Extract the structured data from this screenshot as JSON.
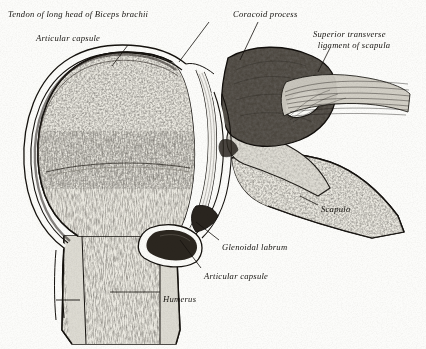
{
  "figure": {
    "style": "engraving",
    "background_color": "#fcfcfa",
    "ink_color": "#15130f"
  },
  "labels": [
    {
      "id": "tendon-biceps",
      "text": "Tendon of long head of Biceps brachii",
      "x": 8,
      "y": 9,
      "lines": 1
    },
    {
      "id": "articular-capsule-top",
      "text": "Articular capsule",
      "x": 36,
      "y": 33,
      "lines": 1
    },
    {
      "id": "coracoid-process",
      "text": "Coracoid process",
      "x": 233,
      "y": 9,
      "lines": 1
    },
    {
      "id": "superior-transverse-ligament",
      "text": "Superior transverse\n  ligament of scapula",
      "x": 313,
      "y": 29,
      "lines": 2
    },
    {
      "id": "scapula",
      "text": "Scapula",
      "x": 321,
      "y": 204,
      "lines": 1
    },
    {
      "id": "glenoidal-labrum",
      "text": "Glenoidal labrum",
      "x": 222,
      "y": 242,
      "lines": 1
    },
    {
      "id": "articular-capsule-lower",
      "text": "Articular capsule",
      "x": 204,
      "y": 271,
      "lines": 1
    },
    {
      "id": "humerus",
      "text": "Humerus",
      "x": 163,
      "y": 294,
      "lines": 1
    }
  ],
  "leader_lines": [
    {
      "id": "leader-tendon-biceps",
      "from": [
        209,
        22
      ],
      "to": [
        179,
        62
      ]
    },
    {
      "id": "leader-articular-capsule-top",
      "from": [
        128,
        45
      ],
      "to": [
        112,
        66
      ]
    },
    {
      "id": "leader-coracoid-process",
      "from": [
        258,
        22
      ],
      "to": [
        240,
        60
      ]
    },
    {
      "id": "leader-superior-transverse-ligament",
      "from": [
        330,
        48
      ],
      "to": [
        318,
        72
      ]
    },
    {
      "id": "leader-scapula",
      "from": [
        318,
        205
      ],
      "to": [
        300,
        196
      ]
    },
    {
      "id": "leader-glenoidal-labrum",
      "from": [
        219,
        240
      ],
      "to": [
        196,
        222
      ]
    },
    {
      "id": "leader-articular-capsule-lower",
      "from": [
        201,
        268
      ],
      "to": [
        180,
        240
      ]
    },
    {
      "id": "leader-humerus",
      "from": [
        160,
        292
      ],
      "to": [
        110,
        292
      ]
    }
  ],
  "structures": [
    {
      "id": "humeral-head",
      "name": "head of humerus",
      "tissue": "cancellous bone"
    },
    {
      "id": "humeral-shaft",
      "name": "shaft of humerus",
      "tissue": "cortical bone with marrow"
    },
    {
      "id": "joint-cavity",
      "name": "glenohumeral joint cavity",
      "tissue": "synovial space"
    },
    {
      "id": "glenoid-labrum",
      "name": "glenoidal labrum",
      "tissue": "fibrocartilage"
    },
    {
      "id": "capsule",
      "name": "articular capsule",
      "tissue": "fibrous capsule"
    },
    {
      "id": "biceps-tendon",
      "name": "tendon of long head of biceps brachii",
      "tissue": "tendon"
    },
    {
      "id": "coracoid-process",
      "name": "coracoid process",
      "tissue": "bone"
    },
    {
      "id": "suprascapular-notch",
      "name": "suprascapular notch",
      "tissue": "aperture"
    },
    {
      "id": "transverse-ligament",
      "name": "superior transverse ligament of scapula",
      "tissue": "ligament"
    },
    {
      "id": "scapula-body",
      "name": "body of scapula",
      "tissue": "cancellous bone"
    }
  ]
}
